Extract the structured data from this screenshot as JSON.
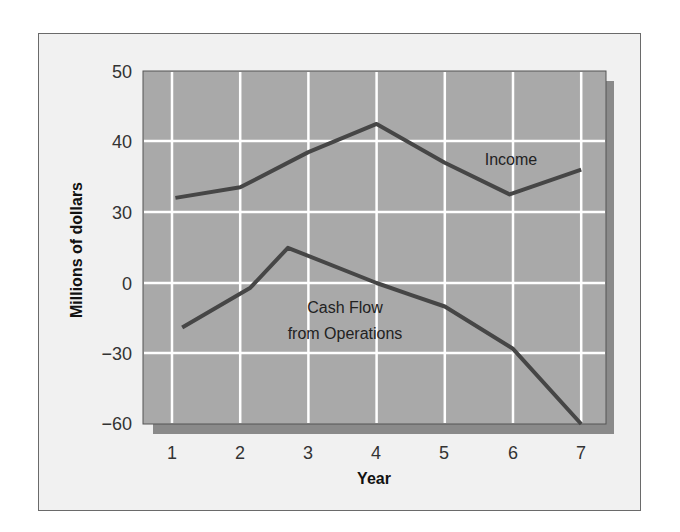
{
  "chart_data": {
    "type": "line",
    "title": "",
    "xlabel": "Year",
    "ylabel": "Millions of dollars",
    "x": [
      1,
      2,
      3,
      4,
      5,
      6,
      7
    ],
    "x_tick_labels": [
      "1",
      "2",
      "3",
      "4",
      "5",
      "6",
      "7"
    ],
    "y_tick_labels": [
      "50",
      "40",
      "30",
      "0",
      "−30",
      "−60"
    ],
    "y_axis_note": "Broken axis: upper section 30–50 (10 per gridline), lower section 0 to −60 (30 per gridline)",
    "grid": true,
    "legend": "inline labels",
    "series": [
      {
        "name": "Income",
        "points": [
          [
            1.05,
            32
          ],
          [
            2,
            33.5
          ],
          [
            3,
            38.5
          ],
          [
            4,
            42.5
          ],
          [
            5,
            37
          ],
          [
            5.95,
            32.5
          ],
          [
            7,
            36
          ]
        ],
        "values": [
          32,
          33.5,
          38.5,
          42.5,
          37,
          32.5,
          36
        ]
      },
      {
        "name": "Cash Flow from Operations",
        "points": [
          [
            1.15,
            -19
          ],
          [
            2.15,
            -2
          ],
          [
            2.7,
            15
          ],
          [
            4,
            0
          ],
          [
            4.5,
            -5
          ],
          [
            5,
            -10
          ],
          [
            6,
            -28
          ],
          [
            7,
            -60
          ]
        ],
        "values": [
          -19,
          -2,
          15,
          0,
          -10,
          -28,
          -60
        ]
      }
    ],
    "labels": {
      "income": "Income",
      "cashflow_line1": "Cash Flow",
      "cashflow_line2": "from Operations"
    }
  },
  "colors": {
    "frame_bg": "#f1f1f1",
    "plot_bg": "#a9a9a9",
    "shadow": "#8a8a8a",
    "grid": "#ffffff",
    "line": "#464646"
  }
}
